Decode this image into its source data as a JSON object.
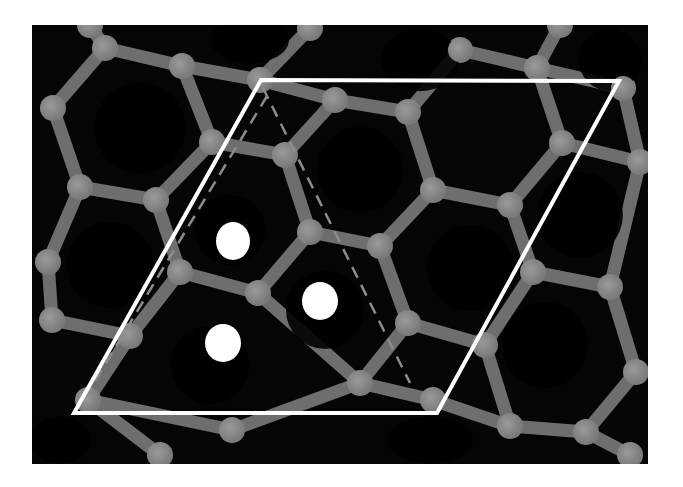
{
  "figure": {
    "width": 683,
    "height": 487,
    "page_background": "#ffffff",
    "panel": {
      "x": 32,
      "y": 25,
      "width": 616,
      "height": 439,
      "fill": "#050505"
    },
    "colors": {
      "bond": "#6e6e6e",
      "bond_highlight": "#8a8a8a",
      "atom": "#7a7a7a",
      "atom_highlight": "#9a9a9a",
      "void": "#000000",
      "cell_edge": "#ffffff",
      "dashed_edge": "#8c8c8c",
      "adsorbate": "#ffffff"
    },
    "atom_radius": 13,
    "bond_width": 13,
    "atoms": [
      {
        "id": "a1",
        "x": 105,
        "y": 48
      },
      {
        "id": "a2",
        "x": 182,
        "y": 66
      },
      {
        "id": "a3",
        "x": 260,
        "y": 80
      },
      {
        "id": "a4",
        "x": 310,
        "y": 28
      },
      {
        "id": "a5",
        "x": 335,
        "y": 100
      },
      {
        "id": "a6",
        "x": 408,
        "y": 112
      },
      {
        "id": "a7",
        "x": 460,
        "y": 50
      },
      {
        "id": "a8",
        "x": 537,
        "y": 68
      },
      {
        "id": "a9",
        "x": 623,
        "y": 88
      },
      {
        "id": "a10",
        "x": 53,
        "y": 108
      },
      {
        "id": "a11",
        "x": 212,
        "y": 142
      },
      {
        "id": "a12",
        "x": 285,
        "y": 155
      },
      {
        "id": "a13",
        "x": 562,
        "y": 143
      },
      {
        "id": "a14",
        "x": 640,
        "y": 162
      },
      {
        "id": "a15",
        "x": 80,
        "y": 187
      },
      {
        "id": "a16",
        "x": 156,
        "y": 200
      },
      {
        "id": "a17",
        "x": 433,
        "y": 190
      },
      {
        "id": "a18",
        "x": 510,
        "y": 205
      },
      {
        "id": "a19",
        "x": 310,
        "y": 232
      },
      {
        "id": "a20",
        "x": 380,
        "y": 246
      },
      {
        "id": "a21",
        "x": 48,
        "y": 262
      },
      {
        "id": "a22",
        "x": 180,
        "y": 272
      },
      {
        "id": "a23",
        "x": 258,
        "y": 293
      },
      {
        "id": "a24",
        "x": 533,
        "y": 272
      },
      {
        "id": "a25",
        "x": 610,
        "y": 287
      },
      {
        "id": "a26",
        "x": 52,
        "y": 320
      },
      {
        "id": "a27",
        "x": 130,
        "y": 336
      },
      {
        "id": "a28",
        "x": 408,
        "y": 323
      },
      {
        "id": "a29",
        "x": 485,
        "y": 345
      },
      {
        "id": "a30",
        "x": 360,
        "y": 383
      },
      {
        "id": "a31",
        "x": 433,
        "y": 400
      },
      {
        "id": "a32",
        "x": 636,
        "y": 372
      },
      {
        "id": "a33",
        "x": 88,
        "y": 400
      },
      {
        "id": "a34",
        "x": 232,
        "y": 430
      },
      {
        "id": "a35",
        "x": 510,
        "y": 426
      },
      {
        "id": "a36",
        "x": 586,
        "y": 432
      },
      {
        "id": "a37",
        "x": 630,
        "y": 455
      },
      {
        "id": "a38",
        "x": 160,
        "y": 455
      },
      {
        "id": "a39",
        "x": 560,
        "y": 25
      },
      {
        "id": "a40",
        "x": 90,
        "y": 25
      }
    ],
    "bonds": [
      [
        "a1",
        "a2"
      ],
      [
        "a2",
        "a3"
      ],
      [
        "a3",
        "a4"
      ],
      [
        "a2",
        "a11"
      ],
      [
        "a1",
        "a10"
      ],
      [
        "a1",
        "a40"
      ],
      [
        "a3",
        "a5"
      ],
      [
        "a5",
        "a6"
      ],
      [
        "a5",
        "a12"
      ],
      [
        "a6",
        "a7"
      ],
      [
        "a7",
        "a8"
      ],
      [
        "a8",
        "a9"
      ],
      [
        "a8",
        "a39"
      ],
      [
        "a6",
        "a17"
      ],
      [
        "a8",
        "a13"
      ],
      [
        "a13",
        "a14"
      ],
      [
        "a9",
        "a14"
      ],
      [
        "a10",
        "a15"
      ],
      [
        "a15",
        "a16"
      ],
      [
        "a16",
        "a11"
      ],
      [
        "a11",
        "a12"
      ],
      [
        "a12",
        "a19"
      ],
      [
        "a17",
        "a18"
      ],
      [
        "a18",
        "a13"
      ],
      [
        "a17",
        "a20"
      ],
      [
        "a19",
        "a20"
      ],
      [
        "a15",
        "a21"
      ],
      [
        "a16",
        "a22"
      ],
      [
        "a22",
        "a23"
      ],
      [
        "a23",
        "a19"
      ],
      [
        "a18",
        "a24"
      ],
      [
        "a24",
        "a25"
      ],
      [
        "a25",
        "a14"
      ],
      [
        "a21",
        "a26"
      ],
      [
        "a26",
        "a27"
      ],
      [
        "a27",
        "a22"
      ],
      [
        "a20",
        "a28"
      ],
      [
        "a28",
        "a29"
      ],
      [
        "a29",
        "a24"
      ],
      [
        "a23",
        "a30"
      ],
      [
        "a28",
        "a30"
      ],
      [
        "a30",
        "a31"
      ],
      [
        "a31",
        "a35"
      ],
      [
        "a29",
        "a35"
      ],
      [
        "a25",
        "a32"
      ],
      [
        "a32",
        "a36"
      ],
      [
        "a35",
        "a36"
      ],
      [
        "a27",
        "a33"
      ],
      [
        "a33",
        "a34"
      ],
      [
        "a34",
        "a30"
      ],
      [
        "a33",
        "a38"
      ],
      [
        "a36",
        "a37"
      ]
    ],
    "voids": [
      {
        "cx": 140,
        "cy": 128,
        "rx": 58,
        "ry": 58
      },
      {
        "cx": 360,
        "cy": 170,
        "rx": 55,
        "ry": 55
      },
      {
        "cx": 580,
        "cy": 215,
        "rx": 55,
        "ry": 55
      },
      {
        "cx": 110,
        "cy": 265,
        "rx": 55,
        "ry": 55
      },
      {
        "cx": 470,
        "cy": 268,
        "rx": 55,
        "ry": 55
      },
      {
        "cx": 230,
        "cy": 230,
        "rx": 45,
        "ry": 45
      },
      {
        "cx": 325,
        "cy": 310,
        "rx": 50,
        "ry": 50
      },
      {
        "cx": 210,
        "cy": 365,
        "rx": 50,
        "ry": 50
      },
      {
        "cx": 545,
        "cy": 345,
        "rx": 55,
        "ry": 55
      },
      {
        "cx": 420,
        "cy": 60,
        "rx": 50,
        "ry": 40
      },
      {
        "cx": 250,
        "cy": 40,
        "rx": 50,
        "ry": 30
      },
      {
        "cx": 610,
        "cy": 60,
        "rx": 40,
        "ry": 40
      },
      {
        "cx": 430,
        "cy": 440,
        "rx": 55,
        "ry": 30
      },
      {
        "cx": 60,
        "cy": 440,
        "rx": 40,
        "ry": 30
      }
    ],
    "unit_cell": {
      "label": "unit-cell",
      "points": [
        [
          261,
          80
        ],
        [
          619,
          81
        ],
        [
          437,
          413
        ],
        [
          74,
          413
        ]
      ],
      "stroke_width": 4
    },
    "dashed_lines": [
      {
        "x1": 263,
        "y1": 88,
        "x2": 410,
        "y2": 383
      },
      {
        "x1": 267,
        "y1": 96,
        "x2": 80,
        "y2": 406
      }
    ],
    "adsorbates": [
      {
        "id": "site-1",
        "cx": 233,
        "cy": 241,
        "rx": 17,
        "ry": 19
      },
      {
        "id": "site-2",
        "cx": 320,
        "cy": 301,
        "rx": 18,
        "ry": 19
      },
      {
        "id": "site-3",
        "cx": 223,
        "cy": 343,
        "rx": 18,
        "ry": 19
      }
    ]
  }
}
